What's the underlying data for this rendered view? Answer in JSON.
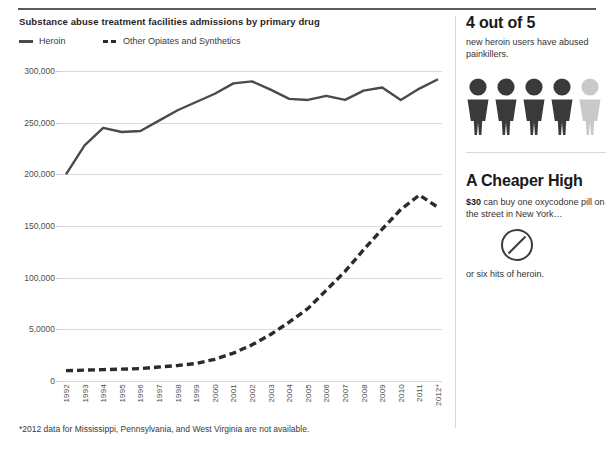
{
  "chart_data": {
    "type": "line",
    "title": "Substance abuse treatment facilities admissions by primary drug",
    "xlabel": "",
    "ylabel": "",
    "ylim": [
      0,
      300000
    ],
    "grid": true,
    "legend_position": "top-left",
    "categories": [
      "1992",
      "1993",
      "1994",
      "1995",
      "1996",
      "1997",
      "1998",
      "1999",
      "2000",
      "2001",
      "2002",
      "2003",
      "2004",
      "2005",
      "2006",
      "2007",
      "2008",
      "2009",
      "2010",
      "2011",
      "2012*"
    ],
    "ytick_labels": [
      "300,000",
      "250,000",
      "200,000",
      "150,000",
      "100,000",
      "5,0000",
      "0"
    ],
    "ytick_values": [
      300000,
      250000,
      200000,
      150000,
      100000,
      50000,
      0
    ],
    "series": [
      {
        "name": "Heroin",
        "style": "solid",
        "color": "#4a4a4a",
        "values": [
          200000,
          228000,
          245000,
          241000,
          242000,
          252000,
          262000,
          270000,
          278000,
          288000,
          290000,
          282000,
          273000,
          272000,
          276000,
          272000,
          281000,
          284000,
          272000,
          283000,
          292000
        ]
      },
      {
        "name": "Other Opiates and Synthetics",
        "style": "dashed",
        "color": "#2b2b2b",
        "values": [
          10000,
          10500,
          11000,
          11500,
          12000,
          13500,
          15000,
          17000,
          21000,
          27000,
          35000,
          45000,
          57000,
          70000,
          88000,
          106000,
          127000,
          147000,
          166000,
          180000,
          168000
        ]
      }
    ],
    "footnote": "*2012 data for Mississippi, Pennsylvania, and West Virginia are not available."
  },
  "legend": {
    "heroin_label": "Heroin",
    "other_label": "Other Opiates and Synthetics"
  },
  "sidebar": {
    "stat": {
      "headline": "4 out of 5",
      "body": "new heroin users have abused painkillers.",
      "filled_count": 5,
      "highlight_count": 4,
      "filled_color": "#3a3a3a",
      "empty_color": "#c9c9c9"
    },
    "price": {
      "headline": "A Cheaper High",
      "body_bold": "$30",
      "body_rest": " can buy one oxycodone pill on the street in New York…",
      "caption": "or six hits of heroin.",
      "bag_count": 6
    }
  }
}
